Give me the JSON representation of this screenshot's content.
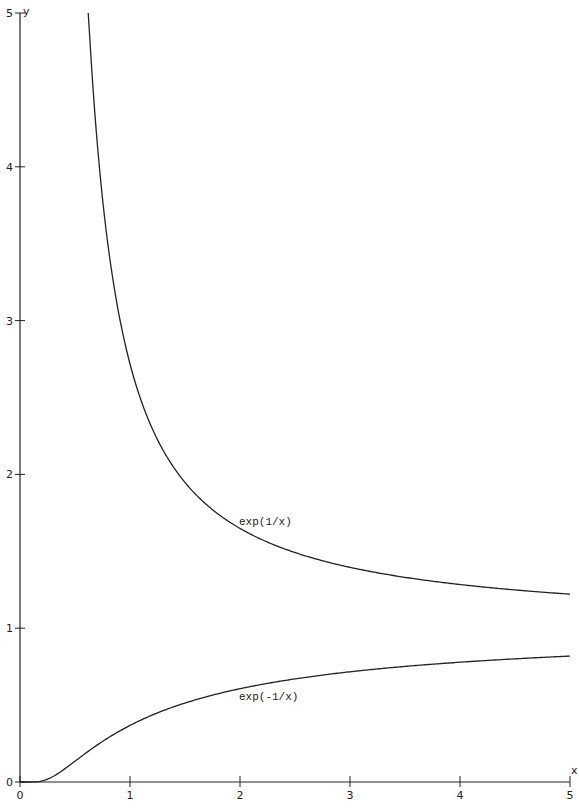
{
  "chart_data": {
    "type": "line",
    "title": "",
    "xlabel": "x",
    "ylabel": "y",
    "xlim": [
      0,
      5
    ],
    "ylim": [
      0,
      5
    ],
    "grid": false,
    "legend": "none (inline labels)",
    "x_ticks": [
      0,
      1,
      2,
      3,
      4,
      5
    ],
    "y_ticks": [
      0,
      1,
      2,
      3,
      4,
      5
    ],
    "series": [
      {
        "name": "exp(1/x)",
        "label_anchor": {
          "x": 2.0,
          "y": 1.65
        },
        "x": [
          0.62,
          0.75,
          1.0,
          1.25,
          1.5,
          2.0,
          2.5,
          3.0,
          3.5,
          4.0,
          4.5,
          5.0
        ],
        "y": [
          5.0,
          3.79,
          2.72,
          2.23,
          1.95,
          1.65,
          1.49,
          1.4,
          1.33,
          1.28,
          1.25,
          1.22
        ]
      },
      {
        "name": "exp(-1/x)",
        "label_anchor": {
          "x": 2.0,
          "y": 0.61
        },
        "x": [
          0.0,
          0.1,
          0.2,
          0.3,
          0.5,
          0.75,
          1.0,
          1.5,
          2.0,
          2.5,
          3.0,
          3.5,
          4.0,
          4.5,
          5.0
        ],
        "y": [
          0.0,
          0.0,
          0.007,
          0.036,
          0.135,
          0.264,
          0.368,
          0.513,
          0.607,
          0.67,
          0.717,
          0.751,
          0.779,
          0.801,
          0.819
        ]
      }
    ]
  },
  "axes": {
    "x_label": "x",
    "y_label": "y",
    "x_tick_labels": [
      "0",
      "1",
      "2",
      "3",
      "4",
      "5"
    ],
    "y_tick_labels": [
      "0",
      "1",
      "2",
      "3",
      "4",
      "5"
    ]
  },
  "curves": {
    "upper_label": "exp(1/x)",
    "lower_label": "exp(-1/x)"
  }
}
